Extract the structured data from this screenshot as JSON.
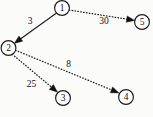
{
  "figure": {
    "type": "directed-graph",
    "width": 153,
    "height": 117,
    "background_color": "#fbfbfa",
    "ink_color": "#1a1a1a"
  },
  "nodes": [
    {
      "id": "1",
      "label": "1",
      "cx": 62,
      "cy": 8,
      "r": 7.4
    },
    {
      "id": "2",
      "label": "2",
      "cx": 8.5,
      "cy": 48,
      "r": 7.4
    },
    {
      "id": "3",
      "label": "3",
      "cx": 63,
      "cy": 98,
      "r": 7.4
    },
    {
      "id": "4",
      "label": "4",
      "cx": 126,
      "cy": 97,
      "r": 7.4
    },
    {
      "id": "5",
      "label": "5",
      "cx": 142,
      "cy": 22,
      "r": 7.4
    }
  ],
  "edges": [
    {
      "id": "e1-2",
      "from": "1",
      "to": "2",
      "weight": "3",
      "style": "solid",
      "arrow": "filled",
      "x1": 56.6,
      "y1": 13.0,
      "x2": 14.2,
      "y2": 43.4,
      "label_x": 30,
      "label_y": 21
    },
    {
      "id": "e1-5",
      "from": "1",
      "to": "5",
      "weight": "30",
      "style": "dotted",
      "arrow": "filled",
      "x1": 69.2,
      "y1": 10.0,
      "x2": 134.8,
      "y2": 20.4,
      "label_x": 104,
      "label_y": 21
    },
    {
      "id": "e2-4",
      "from": "2",
      "to": "4",
      "weight": "8",
      "style": "dotted",
      "arrow": "filled",
      "x1": 15.6,
      "y1": 50.3,
      "x2": 119.0,
      "y2": 93.0,
      "label_x": 68.5,
      "label_y": 64
    },
    {
      "id": "e2-3",
      "from": "2",
      "to": "3",
      "weight": "25",
      "style": "dotted",
      "arrow": "filled",
      "x1": 12.3,
      "y1": 54.3,
      "x2": 57.6,
      "y2": 92.2,
      "label_x": 31.5,
      "label_y": 84
    }
  ],
  "chart_data": {
    "type": "diagram",
    "title": "",
    "nodes": [
      "1",
      "2",
      "3",
      "4",
      "5"
    ],
    "directed_edges": [
      {
        "source": "1",
        "target": "2",
        "weight": 3
      },
      {
        "source": "1",
        "target": "5",
        "weight": 30
      },
      {
        "source": "2",
        "target": "4",
        "weight": 8
      },
      {
        "source": "2",
        "target": "3",
        "weight": 25
      }
    ],
    "edge_styles": {
      "1->2": "solid",
      "1->5": "dotted",
      "2->4": "dotted",
      "2->3": "dotted"
    }
  }
}
